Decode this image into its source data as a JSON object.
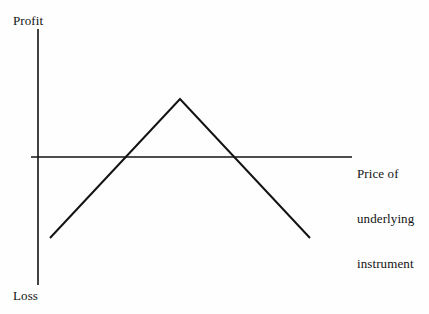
{
  "figure": {
    "background_color": "#fefefe",
    "ink_color": "#131313"
  },
  "labels": {
    "profit": "Profit",
    "loss": "Loss",
    "x_axis_line1": "Price of",
    "x_axis_line2": "underlying",
    "x_axis_line3": "instrument"
  },
  "chart_data": {
    "type": "line",
    "title": "",
    "subtitle": "",
    "xlabel": "Price of underlying instrument",
    "ylabel": "Profit / Loss",
    "grid": false,
    "legend": null,
    "axis_style": {
      "x_axis_y_pixel": 157,
      "y_axis_x_pixel": 38,
      "x_axis_from_pixel": 31,
      "x_axis_to_pixel": 352,
      "y_axis_from_pixel": 29,
      "y_axis_to_pixel": 285,
      "ticks": "none",
      "tick_labels": "none",
      "line_width": 1.4
    },
    "annotations": [
      {
        "text": "Profit",
        "position": "above y-axis top",
        "x_pixel": 13,
        "y_pixel": 13
      },
      {
        "text": "Loss",
        "position": "below y-axis bottom",
        "x_pixel": 13,
        "y_pixel": 288
      },
      {
        "text": "Price of underlying instrument",
        "position": "right of x-axis end",
        "x_pixel": 357,
        "y_pixel": 136
      }
    ],
    "series": [
      {
        "name": "Payoff",
        "shape": "inverted-v",
        "line_width": 2,
        "color": "#131313",
        "points_pixel": [
          {
            "x": 50,
            "y": 238
          },
          {
            "x": 180,
            "y": 99
          },
          {
            "x": 310,
            "y": 238
          }
        ],
        "values": [
          {
            "x": "low price",
            "y": -1.0
          },
          {
            "x": "strike price",
            "y": 0.45
          },
          {
            "x": "high price",
            "y": -1.0
          }
        ],
        "breakeven_points_pixel": [
          125,
          237
        ],
        "max_profit_at_pixel_x": 180,
        "description": "Short straddle payoff: maximum profit at the strike price, losses increasing as the underlying moves away in either direction."
      }
    ],
    "ylim": [
      -1.15,
      0.55
    ],
    "zero_line": "x-axis represents zero profit/loss"
  }
}
